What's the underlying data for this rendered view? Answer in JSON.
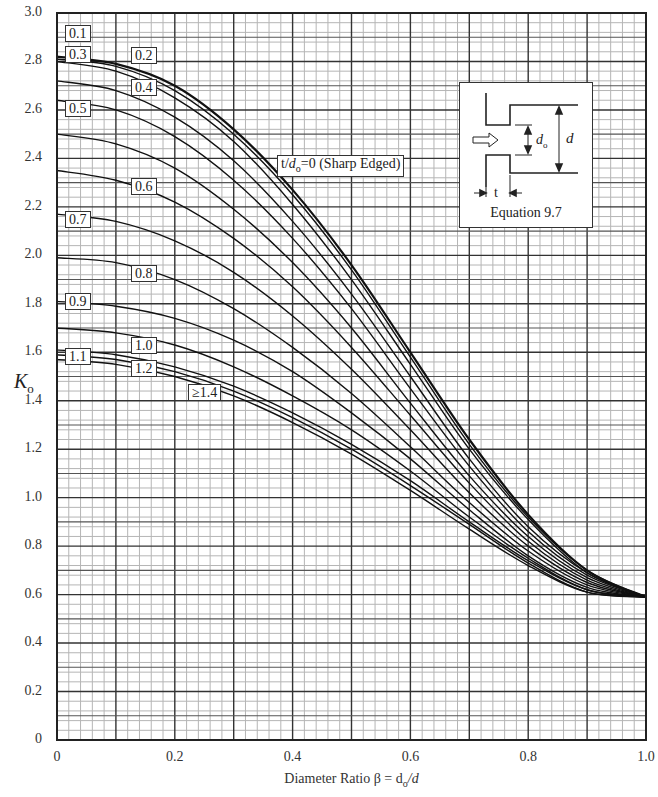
{
  "chart_data": {
    "type": "line",
    "title": "",
    "xlabel": "Diameter Ratio β = d_o/d",
    "ylabel": "K_o",
    "xlim": [
      0,
      1.0
    ],
    "ylim": [
      0,
      3.0
    ],
    "grid": true,
    "x_ticks": [
      "0",
      "0.2",
      "0.4",
      "0.6",
      "0.8",
      "1.0"
    ],
    "y_ticks": [
      "0",
      "0.2",
      "0.4",
      "0.6",
      "0.8",
      "1.0",
      "1.2",
      "1.4",
      "1.6",
      "1.8",
      "2.0",
      "2.2",
      "2.4",
      "2.6",
      "2.8",
      "3.0"
    ],
    "x": [
      0,
      0.1,
      0.2,
      0.3,
      0.4,
      0.5,
      0.6,
      0.7,
      0.8,
      0.9,
      1.0
    ],
    "series": [
      {
        "name": "t/d_o=0 (Sharp Edged)",
        "values": [
          2.82,
          2.79,
          2.7,
          2.52,
          2.27,
          1.96,
          1.6,
          1.24,
          0.93,
          0.7,
          0.59
        ]
      },
      {
        "name": "0.1",
        "values": [
          2.81,
          2.78,
          2.68,
          2.5,
          2.25,
          1.94,
          1.58,
          1.22,
          0.92,
          0.7,
          0.59
        ]
      },
      {
        "name": "0.2",
        "values": [
          2.8,
          2.76,
          2.65,
          2.47,
          2.21,
          1.9,
          1.55,
          1.2,
          0.91,
          0.69,
          0.59
        ]
      },
      {
        "name": "0.3",
        "values": [
          2.72,
          2.68,
          2.57,
          2.39,
          2.14,
          1.84,
          1.5,
          1.16,
          0.88,
          0.69,
          0.59
        ]
      },
      {
        "name": "0.4",
        "values": [
          2.64,
          2.6,
          2.49,
          2.31,
          2.07,
          1.78,
          1.45,
          1.13,
          0.86,
          0.68,
          0.59
        ]
      },
      {
        "name": "0.5",
        "values": [
          2.5,
          2.46,
          2.36,
          2.19,
          1.97,
          1.7,
          1.39,
          1.09,
          0.84,
          0.67,
          0.59
        ]
      },
      {
        "name": "0.6",
        "values": [
          2.35,
          2.31,
          2.22,
          2.07,
          1.87,
          1.62,
          1.34,
          1.06,
          0.82,
          0.66,
          0.59
        ]
      },
      {
        "name": "0.7",
        "values": [
          2.17,
          2.14,
          2.06,
          1.93,
          1.75,
          1.53,
          1.28,
          1.02,
          0.8,
          0.65,
          0.59
        ]
      },
      {
        "name": "0.8",
        "values": [
          1.99,
          1.97,
          1.9,
          1.78,
          1.62,
          1.43,
          1.21,
          0.98,
          0.78,
          0.64,
          0.59
        ]
      },
      {
        "name": "0.9",
        "values": [
          1.81,
          1.79,
          1.74,
          1.65,
          1.52,
          1.35,
          1.16,
          0.95,
          0.76,
          0.63,
          0.59
        ]
      },
      {
        "name": "1.0",
        "values": [
          1.7,
          1.68,
          1.63,
          1.54,
          1.42,
          1.28,
          1.11,
          0.92,
          0.75,
          0.62,
          0.59
        ]
      },
      {
        "name": "1.1",
        "values": [
          1.61,
          1.59,
          1.54,
          1.46,
          1.35,
          1.22,
          1.07,
          0.9,
          0.74,
          0.62,
          0.59
        ]
      },
      {
        "name": "1.2",
        "values": [
          1.59,
          1.57,
          1.52,
          1.44,
          1.33,
          1.2,
          1.05,
          0.89,
          0.73,
          0.61,
          0.59
        ]
      },
      {
        "name": "≥1.4",
        "values": [
          1.57,
          1.55,
          1.5,
          1.42,
          1.31,
          1.18,
          1.03,
          0.87,
          0.72,
          0.61,
          0.59
        ]
      }
    ],
    "annotations": [
      "t/d_o=0 (Sharp Edged)",
      "Equation 9.7"
    ],
    "legend_position": "inline labels"
  },
  "axis": {
    "ylabel_main": "K",
    "ylabel_sub": "o",
    "xlabel": "Diameter Ratio β = d",
    "xlabel_sub": "o",
    "xlabel_tail": "/d"
  },
  "curve_labels": [
    {
      "text": "0.1",
      "x": 65,
      "y": 25
    },
    {
      "text": "0.2",
      "x": 131,
      "y": 47
    },
    {
      "text": "0.3",
      "x": 65,
      "y": 46
    },
    {
      "text": "0.4",
      "x": 131,
      "y": 79
    },
    {
      "text": "0.5",
      "x": 65,
      "y": 100
    },
    {
      "text": "0.6",
      "x": 131,
      "y": 178
    },
    {
      "text": "0.7",
      "x": 65,
      "y": 211
    },
    {
      "text": "0.8",
      "x": 131,
      "y": 265
    },
    {
      "text": "0.9",
      "x": 65,
      "y": 293
    },
    {
      "text": "1.0",
      "x": 131,
      "y": 337
    },
    {
      "text": "1.1",
      "x": 65,
      "y": 348
    },
    {
      "text": "1.2",
      "x": 131,
      "y": 360
    },
    {
      "text": "≥1.4",
      "x": 188,
      "y": 384
    }
  ],
  "sharp_label": {
    "prefix": "t/",
    "var": "d",
    "sub": "o",
    "suffix": "=0 (Sharp Edged)"
  },
  "inset": {
    "caption": "Equation 9.7",
    "label_do": "d",
    "label_do_sub": "o",
    "label_d": "d",
    "label_t": "t"
  }
}
